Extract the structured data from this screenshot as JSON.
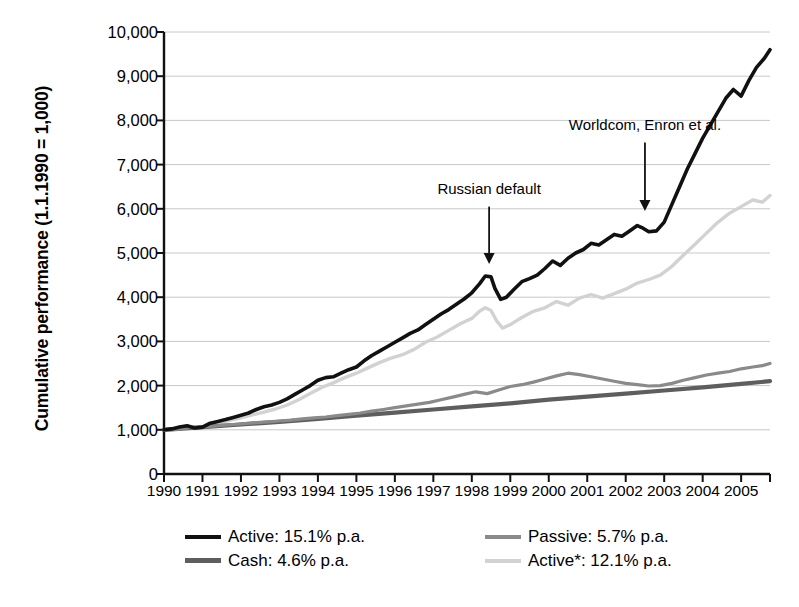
{
  "chart_data": {
    "type": "line",
    "title": "",
    "xlabel": "",
    "ylabel": "Cumulative performance (1.1.1990 = 1,000)",
    "ylim": [
      0,
      10000
    ],
    "xlim": [
      1990,
      2005.75
    ],
    "grid": true,
    "legend_position": "bottom",
    "ytick_labels": [
      "10,000",
      "9,000",
      "8,000",
      "7,000",
      "6,000",
      "5,000",
      "4,000",
      "3,000",
      "2,000",
      "1,000",
      "0"
    ],
    "ytick_values": [
      10000,
      9000,
      8000,
      7000,
      6000,
      5000,
      4000,
      3000,
      2000,
      1000,
      0
    ],
    "xtick_labels": [
      "1990",
      "1991",
      "1992",
      "1993",
      "1994",
      "1995",
      "1996",
      "1997",
      "1998",
      "1999",
      "2000",
      "2001",
      "2002",
      "2003",
      "2004",
      "2005"
    ],
    "xtick_values": [
      1990,
      1991,
      1992,
      1993,
      1994,
      1995,
      1996,
      1997,
      1998,
      1999,
      2000,
      2001,
      2002,
      2003,
      2004,
      2005
    ],
    "annotations": [
      {
        "text": "Russian default",
        "x": 1998.45,
        "label_y": 6450,
        "arrow_from_y": 6050,
        "arrow_to_y": 4750
      },
      {
        "text": "Worldcom, Enron et al.",
        "x": 2002.5,
        "label_y": 7900,
        "arrow_from_y": 7500,
        "arrow_to_y": 5950
      }
    ],
    "series": [
      {
        "name": "Active",
        "legend_label": "Active: 15.1% p.a.",
        "color": "#111111",
        "width": 3.6,
        "x": [
          1990.0,
          1990.2,
          1990.4,
          1990.6,
          1990.8,
          1991.0,
          1991.2,
          1991.4,
          1991.6,
          1991.8,
          1992.0,
          1992.2,
          1992.4,
          1992.6,
          1992.8,
          1993.0,
          1993.2,
          1993.4,
          1993.6,
          1993.8,
          1994.0,
          1994.2,
          1994.4,
          1994.6,
          1994.8,
          1995.0,
          1995.2,
          1995.4,
          1995.6,
          1995.8,
          1996.0,
          1996.2,
          1996.4,
          1996.6,
          1996.8,
          1997.0,
          1997.2,
          1997.4,
          1997.6,
          1997.8,
          1998.0,
          1998.2,
          1998.35,
          1998.5,
          1998.6,
          1998.75,
          1998.9,
          1999.1,
          1999.3,
          1999.5,
          1999.7,
          1999.9,
          2000.1,
          2000.3,
          2000.5,
          2000.7,
          2000.9,
          2001.1,
          2001.3,
          2001.5,
          2001.7,
          2001.9,
          2002.1,
          2002.3,
          2002.45,
          2002.6,
          2002.8,
          2003.0,
          2003.2,
          2003.4,
          2003.6,
          2003.8,
          2004.0,
          2004.2,
          2004.4,
          2004.6,
          2004.8,
          2005.0,
          2005.2,
          2005.4,
          2005.6,
          2005.75
        ],
        "values": [
          1000,
          1020,
          1060,
          1090,
          1040,
          1060,
          1150,
          1190,
          1230,
          1280,
          1330,
          1380,
          1460,
          1520,
          1560,
          1620,
          1700,
          1800,
          1900,
          2000,
          2120,
          2180,
          2200,
          2280,
          2360,
          2420,
          2560,
          2680,
          2780,
          2880,
          2980,
          3080,
          3180,
          3260,
          3380,
          3500,
          3620,
          3720,
          3840,
          3960,
          4100,
          4300,
          4480,
          4460,
          4200,
          3950,
          4000,
          4180,
          4350,
          4420,
          4500,
          4650,
          4820,
          4720,
          4880,
          5000,
          5080,
          5220,
          5180,
          5300,
          5420,
          5380,
          5500,
          5620,
          5560,
          5480,
          5500,
          5700,
          6100,
          6500,
          6900,
          7250,
          7600,
          7900,
          8200,
          8500,
          8700,
          8550,
          8900,
          9200,
          9400,
          9600
        ]
      },
      {
        "name": "Active*",
        "legend_label": "Active*: 12.1% p.a.",
        "color": "#d2d2d2",
        "width": 3.4,
        "x": [
          1990.0,
          1990.2,
          1990.4,
          1990.6,
          1990.8,
          1991.0,
          1991.2,
          1991.4,
          1991.6,
          1991.8,
          1992.0,
          1992.3,
          1992.6,
          1992.9,
          1993.2,
          1993.5,
          1993.8,
          1994.1,
          1994.4,
          1994.7,
          1995.0,
          1995.3,
          1995.6,
          1995.9,
          1996.2,
          1996.5,
          1996.8,
          1997.1,
          1997.4,
          1997.7,
          1998.0,
          1998.2,
          1998.35,
          1998.5,
          1998.65,
          1998.8,
          1999.0,
          1999.3,
          1999.6,
          1999.9,
          2000.2,
          2000.5,
          2000.8,
          2001.1,
          2001.4,
          2001.7,
          2002.0,
          2002.3,
          2002.6,
          2002.9,
          2003.2,
          2003.5,
          2003.8,
          2004.1,
          2004.4,
          2004.7,
          2005.0,
          2005.3,
          2005.55,
          2005.75
        ],
        "values": [
          1000,
          1010,
          1040,
          1070,
          1030,
          1050,
          1110,
          1150,
          1190,
          1230,
          1270,
          1340,
          1400,
          1470,
          1560,
          1680,
          1820,
          1960,
          2060,
          2180,
          2280,
          2400,
          2520,
          2620,
          2700,
          2820,
          2980,
          3100,
          3250,
          3400,
          3520,
          3680,
          3760,
          3700,
          3460,
          3300,
          3380,
          3540,
          3680,
          3760,
          3900,
          3820,
          3980,
          4060,
          3980,
          4080,
          4180,
          4320,
          4400,
          4500,
          4700,
          4950,
          5200,
          5450,
          5700,
          5900,
          6050,
          6200,
          6150,
          6300
        ]
      },
      {
        "name": "Passive",
        "legend_label": "Passive: 5.7% p.a.",
        "color": "#8a8a8a",
        "width": 3.2,
        "x": [
          1990.0,
          1990.3,
          1990.6,
          1990.9,
          1991.2,
          1991.5,
          1991.8,
          1992.1,
          1992.4,
          1992.7,
          1993.0,
          1993.3,
          1993.6,
          1993.9,
          1994.2,
          1994.5,
          1994.8,
          1995.1,
          1995.4,
          1995.7,
          1996.0,
          1996.3,
          1996.6,
          1996.9,
          1997.2,
          1997.5,
          1997.8,
          1998.1,
          1998.4,
          1998.7,
          1999.0,
          1999.3,
          1999.6,
          1999.9,
          2000.2,
          2000.5,
          2000.8,
          2001.1,
          2001.4,
          2001.7,
          2002.0,
          2002.3,
          2002.6,
          2002.9,
          2003.2,
          2003.5,
          2003.8,
          2004.1,
          2004.4,
          2004.7,
          2005.0,
          2005.3,
          2005.55,
          2005.75
        ],
        "values": [
          1000,
          1010,
          1040,
          1060,
          1080,
          1100,
          1120,
          1140,
          1160,
          1180,
          1200,
          1220,
          1250,
          1270,
          1290,
          1320,
          1350,
          1380,
          1420,
          1460,
          1500,
          1540,
          1580,
          1620,
          1680,
          1740,
          1800,
          1860,
          1820,
          1900,
          1980,
          2020,
          2080,
          2150,
          2220,
          2280,
          2250,
          2200,
          2150,
          2100,
          2050,
          2020,
          1990,
          2000,
          2050,
          2120,
          2180,
          2240,
          2280,
          2320,
          2380,
          2420,
          2450,
          2500
        ]
      },
      {
        "name": "Cash",
        "legend_label": "Cash: 4.6% p.a.",
        "color": "#5e5e5e",
        "width": 4.2,
        "x": [
          1990.0,
          1991.0,
          1992.0,
          1993.0,
          1994.0,
          1995.0,
          1996.0,
          1997.0,
          1998.0,
          1999.0,
          2000.0,
          2001.0,
          2002.0,
          2003.0,
          2004.0,
          2005.0,
          2005.75
        ],
        "values": [
          1000,
          1060,
          1120,
          1180,
          1250,
          1320,
          1390,
          1460,
          1530,
          1600,
          1680,
          1750,
          1820,
          1890,
          1960,
          2040,
          2100
        ]
      }
    ]
  }
}
